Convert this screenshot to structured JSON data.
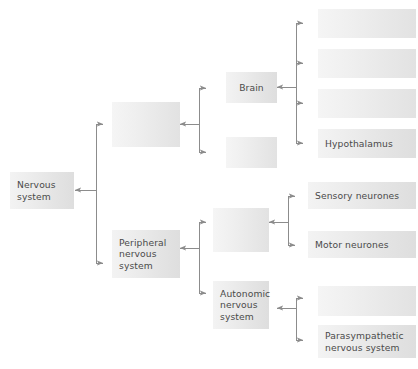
{
  "diagram": {
    "type": "hierarchy-tree",
    "background_color": "#ffffff",
    "box_fill_light": "#f3f3f3",
    "box_fill_dark": "#dedede",
    "text_color": "#4a4a4a",
    "connector_color": "#8c8c8c"
  },
  "nodes": {
    "root": {
      "label": "Nervous\nsystem",
      "filled": true
    },
    "central_nervous_system": {
      "label": "",
      "filled": false
    },
    "peripheral_nervous_system": {
      "label": "Peripheral\nnervous\nsystem",
      "filled": true
    },
    "brain": {
      "label": "Brain",
      "filled": true
    },
    "spinal_cord": {
      "label": "",
      "filled": false
    },
    "brain_part_1": {
      "label": "",
      "filled": false
    },
    "brain_part_2": {
      "label": "",
      "filled": false
    },
    "brain_part_3": {
      "label": "",
      "filled": false
    },
    "hypothalamus": {
      "label": "Hypothalamus",
      "filled": true
    },
    "somatic_nervous_system": {
      "label": "",
      "filled": false
    },
    "sensory_neurones": {
      "label": "Sensory neurones",
      "filled": true
    },
    "motor_neurones": {
      "label": "Motor neurones",
      "filled": true
    },
    "autonomic_nervous_system": {
      "label": "Autonomic\nnervous\nsystem",
      "filled": true
    },
    "sympathetic_nervous_system": {
      "label": "",
      "filled": false
    },
    "parasympathetic_nervous_system": {
      "label": "Parasympathetic\nnervous system",
      "filled": true
    }
  }
}
